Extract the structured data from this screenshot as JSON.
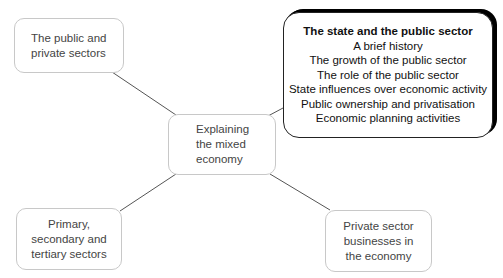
{
  "diagram": {
    "type": "mind-map",
    "central": {
      "lines": [
        "Explaining",
        "the mixed",
        "economy"
      ]
    },
    "nodes": [
      {
        "id": "public-private",
        "lines": [
          "The public and",
          "private sectors"
        ]
      },
      {
        "id": "state-public",
        "title": "The state and the public sector",
        "items": [
          "A brief history",
          "The growth of the public sector",
          "The role of the public sector",
          "State influences over economic activity",
          "Public ownership and privatisation",
          "Economic planning activities"
        ]
      },
      {
        "id": "sectors",
        "lines": [
          "Primary,",
          "secondary and",
          "tertiary sectors"
        ]
      },
      {
        "id": "private-business",
        "lines": [
          "Private sector",
          "businesses in",
          "the economy"
        ]
      }
    ],
    "colors": {
      "line": "#555555",
      "border": "#c8c8c8",
      "featured_border": "#000000"
    }
  }
}
